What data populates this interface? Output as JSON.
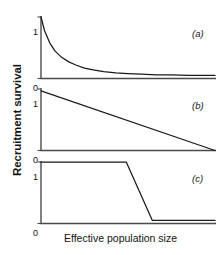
{
  "figure": {
    "background": "#ffffff",
    "line_color": "#1a1a1a",
    "axis_color": "#4a4a4a",
    "ylabel": "Recruitment survival",
    "xlabel": "Effective population size"
  },
  "chart_data": [
    {
      "type": "line",
      "panel_label": "(a)",
      "title": "",
      "xlabel": "Effective population size",
      "ylabel": "Recruitment survival",
      "xlim": [
        0,
        1
      ],
      "ylim": [
        0,
        1
      ],
      "yticks": [
        0,
        1
      ],
      "ytick_labels": [
        "0",
        "1"
      ],
      "xticks": [],
      "xtick_labels": [],
      "grid": false,
      "legend": false,
      "description": "steep exponential decay from 1 to an asymptote near 0.05",
      "x": [
        0.0,
        0.02,
        0.05,
        0.08,
        0.12,
        0.16,
        0.2,
        0.25,
        0.3,
        0.36,
        0.43,
        0.5,
        0.58,
        0.66,
        0.75,
        0.85,
        1.0
      ],
      "values": [
        1.0,
        0.78,
        0.58,
        0.45,
        0.34,
        0.27,
        0.22,
        0.17,
        0.14,
        0.11,
        0.09,
        0.08,
        0.07,
        0.06,
        0.06,
        0.05,
        0.05
      ]
    },
    {
      "type": "line",
      "panel_label": "(b)",
      "title": "",
      "xlabel": "Effective population size",
      "ylabel": "Recruitment survival",
      "xlim": [
        0,
        1
      ],
      "ylim": [
        0,
        1
      ],
      "yticks": [
        0,
        1
      ],
      "ytick_labels": [
        "0",
        "1"
      ],
      "xticks": [],
      "xtick_labels": [],
      "grid": false,
      "legend": false,
      "description": "linear decline from 0.97 at the left axis to 0 at the right edge",
      "x": [
        0.0,
        1.0
      ],
      "values": [
        0.97,
        0.0
      ]
    },
    {
      "type": "line",
      "panel_label": "(c)",
      "title": "",
      "xlabel": "Effective population size",
      "ylabel": "Recruitment survival",
      "xlim": [
        0,
        1
      ],
      "ylim": [
        0,
        1
      ],
      "yticks": [
        0,
        1
      ],
      "ytick_labels": [
        "0",
        "1"
      ],
      "xticks": [],
      "xtick_labels": [],
      "grid": false,
      "legend": false,
      "description": "threshold response: flat at 1 until about half the x range, steep drop, then flat near 0.05",
      "x": [
        0.0,
        0.49,
        0.64,
        1.0
      ],
      "values": [
        1.0,
        1.0,
        0.05,
        0.05
      ]
    }
  ],
  "panels": [
    {
      "label": "(a)",
      "ytop": "1",
      "ybottom": "0"
    },
    {
      "label": "(b)",
      "ytop": "1",
      "ybottom": "0"
    },
    {
      "label": "(c)",
      "ytop": "1",
      "ybottom": "0"
    }
  ]
}
